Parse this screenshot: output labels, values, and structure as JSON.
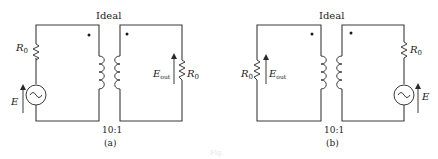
{
  "figure": {
    "caption": "Fig.",
    "diagrams": [
      {
        "id": "a",
        "label": "(a)",
        "transformer_label": "Ideal",
        "ratio": "10:1",
        "primary": {
          "resistor": "R",
          "resistor_sub": "0",
          "source": "E",
          "source_symbol": "~"
        },
        "secondary": {
          "output": "E",
          "output_sub": "out",
          "resistor": "R",
          "resistor_sub": "0"
        }
      },
      {
        "id": "b",
        "label": "(b)",
        "transformer_label": "Ideal",
        "ratio": "10:1",
        "primary": {
          "resistor": "R",
          "resistor_sub": "0",
          "output": "E",
          "output_sub": "out"
        },
        "secondary": {
          "resistor": "R",
          "resistor_sub": "0",
          "source": "E",
          "source_symbol": "~"
        }
      }
    ]
  }
}
